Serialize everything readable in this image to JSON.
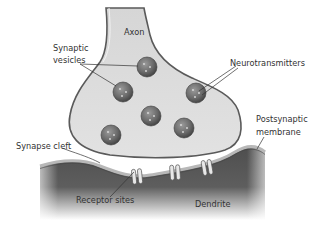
{
  "diagram": {
    "title": "Synapse",
    "labels": {
      "axon": "Axon",
      "synaptic_vesicles_line1": "Synaptic",
      "synaptic_vesicles_line2": "vesicles",
      "neurotransmitters": "Neurotransmitters",
      "postsynaptic_line1": "Postsynaptic",
      "postsynaptic_line2": "membrane",
      "synapse_cleft": "Synapse cleft",
      "receptor_sites": "Receptor sites",
      "dendrite": "Dendrite"
    },
    "colors": {
      "axon_fill": "#dcdcdc",
      "axon_stroke": "#5a5a5a",
      "vesicle": "#6e6e6e",
      "dendrite": "#595959",
      "membrane": "#b0b0b0",
      "receptor": "#e6e6e6",
      "text": "#333333"
    },
    "vesicle_count": 6,
    "receptor_count": 3
  }
}
